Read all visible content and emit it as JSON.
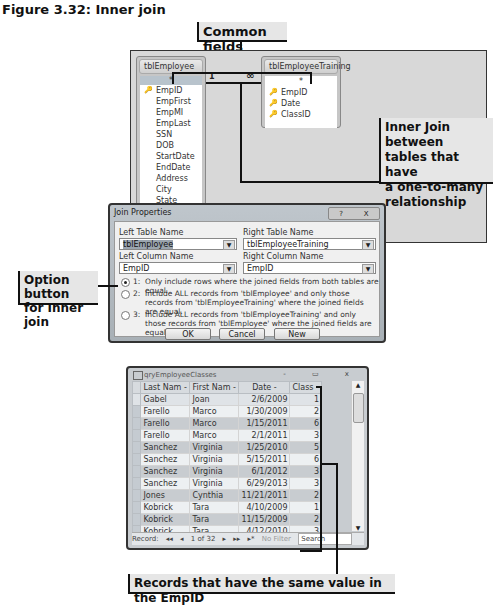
{
  "figure": {
    "title": "Figure 3.32: Inner join"
  },
  "callouts": {
    "common_fields": "Common fields",
    "inner_join": [
      "Inner Join between",
      "tables that have",
      "a one-to-many",
      "relationship"
    ],
    "option_button": [
      "Option button",
      "for Inner join"
    ],
    "records": "Records that have the same value in the EmpID"
  },
  "relationships": {
    "left_table": {
      "name": "tblEmployee",
      "star": "*",
      "fields": [
        {
          "name": "EmpID",
          "key": true
        },
        {
          "name": "EmpFirst",
          "key": false
        },
        {
          "name": "EmpMI",
          "key": false
        },
        {
          "name": "EmpLast",
          "key": false
        },
        {
          "name": "SSN",
          "key": false
        },
        {
          "name": "DOB",
          "key": false
        },
        {
          "name": "StartDate",
          "key": false
        },
        {
          "name": "EndDate",
          "key": false
        },
        {
          "name": "Address",
          "key": false
        },
        {
          "name": "City",
          "key": false
        },
        {
          "name": "State",
          "key": false
        }
      ]
    },
    "right_table": {
      "name": "tblEmployeeTraining",
      "star": "*",
      "fields": [
        {
          "name": "EmpID",
          "key": true
        },
        {
          "name": "Date",
          "key": true
        },
        {
          "name": "ClassID",
          "key": true
        }
      ]
    },
    "one_label": "1",
    "many_label": "∞"
  },
  "dialog": {
    "title": "Join Properties",
    "help_btn": "?",
    "close_btn": "X",
    "left_table_label": "Left Table Name",
    "left_table_value": "tblEmployee",
    "right_table_label": "Right Table Name",
    "right_table_value": "tblEmployeeTraining",
    "left_column_label": "Left Column Name",
    "left_column_value": "EmpID",
    "right_column_label": "Right Column Name",
    "right_column_value": "EmpID",
    "options": [
      {
        "num": "1:",
        "text": "Only include rows where the joined fields from both tables are equal.",
        "selected": true
      },
      {
        "num": "2:",
        "text": "Include ALL records from 'tblEmployee' and only those records from 'tblEmployeeTraining' where the joined fields are equal.",
        "selected": false
      },
      {
        "num": "3:",
        "text": "Include ALL records from 'tblEmployeeTraining' and only those records from 'tblEmployee' where the joined fields are equal.",
        "selected": false
      }
    ],
    "ok": "OK",
    "cancel": "Cancel",
    "new": "New"
  },
  "datasheet": {
    "title": "qryEmployeeClasses",
    "columns": [
      "Last Nam -",
      "First Nam -",
      "Date -",
      "Class -"
    ],
    "rows": [
      [
        "Gabel",
        "Joan",
        "2/6/2009",
        "1"
      ],
      [
        "Farello",
        "Marco",
        "1/30/2009",
        "2"
      ],
      [
        "Farello",
        "Marco",
        "1/15/2011",
        "6"
      ],
      [
        "Farello",
        "Marco",
        "2/1/2011",
        "3"
      ],
      [
        "Sanchez",
        "Virginia",
        "1/25/2010",
        "5"
      ],
      [
        "Sanchez",
        "Virginia",
        "5/15/2011",
        "6"
      ],
      [
        "Sanchez",
        "Virginia",
        "6/1/2012",
        "3"
      ],
      [
        "Sanchez",
        "Virginia",
        "6/29/2013",
        "3"
      ],
      [
        "Jones",
        "Cynthia",
        "11/21/2011",
        "2"
      ],
      [
        "Kobrick",
        "Tara",
        "4/10/2009",
        "1"
      ],
      [
        "Kobrick",
        "Tara",
        "11/15/2009",
        "2"
      ],
      [
        "Kobrick",
        "Tara",
        "4/12/2010",
        "3"
      ]
    ],
    "nav": {
      "record_label": "Record:",
      "first": "◂◂",
      "prev": "◂",
      "position": "1 of 32",
      "next": "▸",
      "last": "▸▸",
      "new": "▸*",
      "filter": "No Filter",
      "search": "Search"
    },
    "window_controls": [
      "-",
      "▭",
      "x"
    ]
  }
}
